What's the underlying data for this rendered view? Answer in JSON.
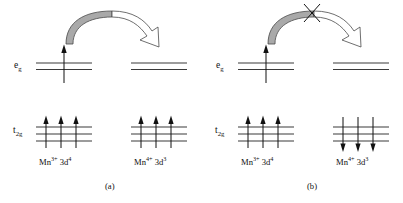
{
  "figure": {
    "width": 403,
    "height": 203,
    "background": "#ffffff"
  },
  "colors": {
    "line": "#3a3a3a",
    "ink": "#111111",
    "arrow_fill_gray": "#a9a9a9",
    "arrow_fill_white": "#ffffff",
    "arrow_outline": "#4a4a4a"
  },
  "orbital_labels": {
    "eg": "e",
    "eg_sub": "g",
    "t2g": "t",
    "t2g_sub": "2g"
  },
  "ion_labels": {
    "mn3_element": "Mn",
    "mn3_charge": "3+",
    "mn3_config": " 3d",
    "mn3_count": "4",
    "mn4_element": "Mn",
    "mn4_charge": "4+",
    "mn4_config": " 3d",
    "mn4_count": "3"
  },
  "panels": [
    {
      "id": "a",
      "caption": "(a)",
      "hopping_allowed": true,
      "blocked_marker": null,
      "left_site": {
        "ion": "Mn3+ 3d4",
        "eg_electrons": 1,
        "eg_spin": "up",
        "t2g_electrons": 3,
        "t2g_spin": "up"
      },
      "right_site": {
        "ion": "Mn4+ 3d3",
        "eg_electrons": 0,
        "eg_spin": null,
        "t2g_electrons": 3,
        "t2g_spin": "up"
      }
    },
    {
      "id": "b",
      "caption": "(b)",
      "hopping_allowed": false,
      "blocked_marker": "x-cross",
      "left_site": {
        "ion": "Mn3+ 3d4",
        "eg_electrons": 1,
        "eg_spin": "up",
        "t2g_electrons": 3,
        "t2g_spin": "up"
      },
      "right_site": {
        "ion": "Mn4+ 3d3",
        "eg_electrons": 0,
        "eg_spin": null,
        "t2g_electrons": 3,
        "t2g_spin": "down"
      }
    }
  ]
}
